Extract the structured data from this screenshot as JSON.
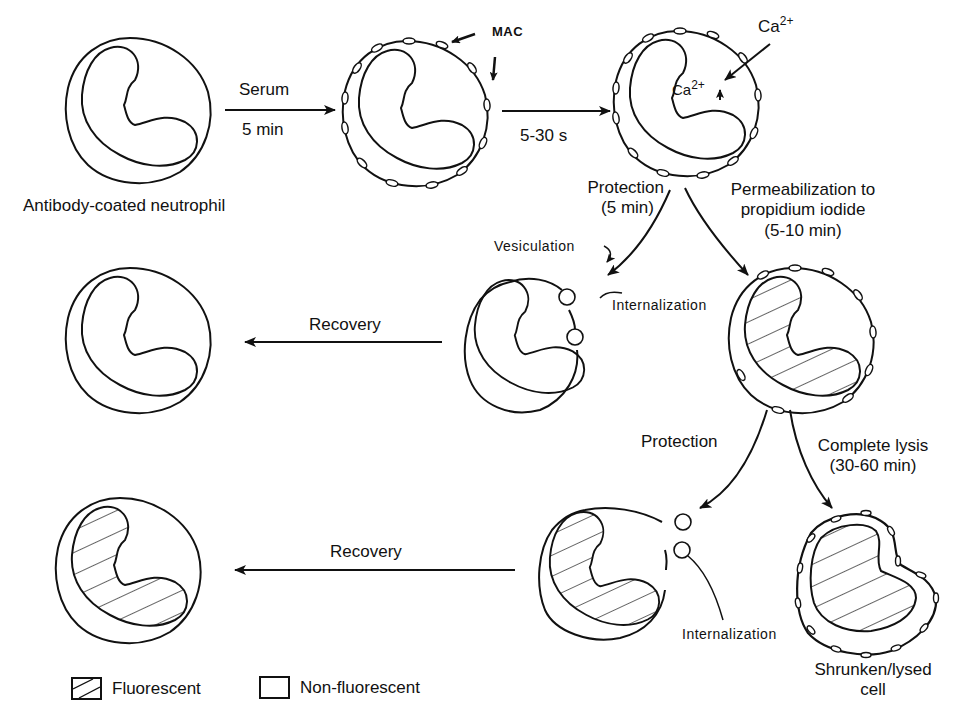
{
  "figure": {
    "cells": {
      "start": {
        "caption": "Antibody-coated neutrophil",
        "fluorescent": false,
        "mac": false
      },
      "mac_attached": {
        "annotation": "MAC",
        "fluorescent": false,
        "mac": true
      },
      "calcium_influx": {
        "external_ion": "Ca",
        "external_charge": "2+",
        "internal_ion": "Ca",
        "internal_charge": "2+",
        "fluorescent": false,
        "mac": true
      },
      "protected_early": {
        "label_vesiculation": "Vesiculation",
        "label_internalization": "Internalization",
        "fluorescent": false
      },
      "permeabilized": {
        "fluorescent": true,
        "mac": true
      },
      "recovered_early": {
        "fluorescent": false
      },
      "protected_late": {
        "label_internalization": "Internalization",
        "fluorescent": true
      },
      "lysed": {
        "caption_line1": "Shrunken/lysed",
        "caption_line2": "cell",
        "fluorescent": true,
        "mac": true
      },
      "recovered_late": {
        "fluorescent": true
      }
    },
    "arrows": {
      "serum": {
        "top": "Serum",
        "bottom": "5 min"
      },
      "fast": {
        "bottom": "5-30 s"
      },
      "protection_early": {
        "line1": "Protection",
        "line2": "(5 min)"
      },
      "permeabilization": {
        "line1": "Permeabilization to",
        "line2": "propidium iodide",
        "line3": "(5-10 min)"
      },
      "recovery_top": {
        "label": "Recovery"
      },
      "protection_late": {
        "label": "Protection"
      },
      "complete_lysis": {
        "line1": "Complete lysis",
        "line2": "(30-60 min)"
      },
      "recovery_bottom": {
        "label": "Recovery"
      }
    },
    "legend": [
      {
        "pattern": "hatched",
        "label": "Fluorescent"
      },
      {
        "pattern": "empty",
        "label": "Non-fluorescent"
      }
    ]
  }
}
